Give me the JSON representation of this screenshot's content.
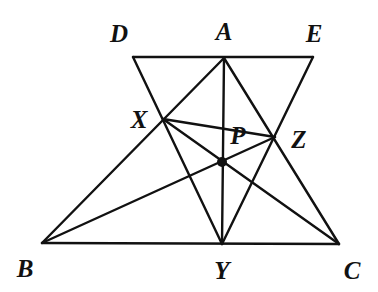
{
  "figure": {
    "kind": "geometry-diagram",
    "background_color": "#ffffff",
    "stroke_color": "#111111",
    "stroke_width": 2.4,
    "canvas": {
      "width": 378,
      "height": 292
    }
  },
  "points": [
    {
      "id": "D",
      "label": "D",
      "x": 133,
      "y": 57,
      "label_x": 119,
      "label_y": 33,
      "marked": false
    },
    {
      "id": "A",
      "label": "A",
      "x": 224,
      "y": 58,
      "label_x": 224,
      "label_y": 31,
      "marked": false
    },
    {
      "id": "E",
      "label": "E",
      "x": 313,
      "y": 57,
      "label_x": 314,
      "label_y": 33,
      "marked": false
    },
    {
      "id": "X",
      "label": "X",
      "x": 163,
      "y": 119,
      "label_x": 139,
      "label_y": 119,
      "marked": false
    },
    {
      "id": "Z",
      "label": "Z",
      "x": 275,
      "y": 137,
      "label_x": 299,
      "label_y": 139,
      "marked": false
    },
    {
      "id": "P",
      "label": "P",
      "x": 222,
      "y": 162,
      "label_x": 238,
      "label_y": 135,
      "marked": true
    },
    {
      "id": "B",
      "label": "B",
      "x": 42,
      "y": 243,
      "label_x": 25,
      "label_y": 268,
      "marked": false
    },
    {
      "id": "Y",
      "label": "Y",
      "x": 222,
      "y": 244,
      "label_x": 222,
      "label_y": 270,
      "marked": false
    },
    {
      "id": "C",
      "label": "C",
      "x": 339,
      "y": 244,
      "label_x": 352,
      "label_y": 270,
      "marked": false
    }
  ],
  "segments": [
    {
      "id": "DE",
      "from": "D",
      "to": "E",
      "name": "segment-de-top-parallel"
    },
    {
      "id": "BC",
      "from": "B",
      "to": "C",
      "name": "segment-bc-base"
    },
    {
      "id": "DY",
      "from": "D",
      "to": "Y",
      "name": "segment-d-to-y"
    },
    {
      "id": "EY",
      "from": "E",
      "to": "Y",
      "name": "segment-e-to-y"
    },
    {
      "id": "AB",
      "from": "A",
      "to": "B",
      "name": "segment-a-to-b"
    },
    {
      "id": "AC",
      "from": "A",
      "to": "C",
      "name": "segment-a-to-c"
    },
    {
      "id": "AY",
      "from": "A",
      "to": "Y",
      "name": "median-a-to-y"
    },
    {
      "id": "BZ",
      "from": "B",
      "to": "Z",
      "name": "cevian-b-to-z"
    },
    {
      "id": "CX",
      "from": "C",
      "to": "X",
      "name": "cevian-c-to-x"
    },
    {
      "id": "XZ",
      "from": "X",
      "to": "Z",
      "name": "segment-x-to-z"
    }
  ],
  "marked_point_radius": 5
}
